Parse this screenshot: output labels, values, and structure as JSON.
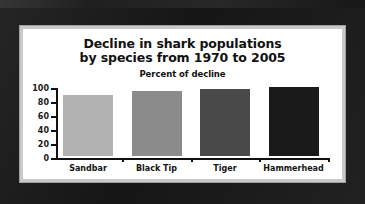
{
  "chart_data": {
    "type": "bar",
    "title": "Decline in shark populations by species from 1970 to 2005",
    "title_line1": "Decline in shark populations",
    "title_line2": "by species from 1970 to 2005",
    "subtitle": "Percent of decline",
    "xlabel": "",
    "ylabel": "",
    "ylim": [
      0,
      100
    ],
    "grid": false,
    "legend": "none",
    "categories": [
      "Sandbar",
      "Black Tip",
      "Tiger",
      "Hammerhead"
    ],
    "values": [
      87,
      93,
      96,
      99
    ],
    "y_ticks": [
      "0",
      "20",
      "40",
      "60",
      "80",
      "100"
    ],
    "y_tick_values": [
      0,
      20,
      40,
      60,
      80,
      100
    ],
    "bar_colors": [
      "#b2b2b2",
      "#8b8b8b",
      "#494949",
      "#1a1a1a"
    ]
  },
  "frame": {
    "background_color": "#1d1d1d",
    "bevel_color": "#c9c9c9",
    "panel_color": "#ffffff"
  }
}
